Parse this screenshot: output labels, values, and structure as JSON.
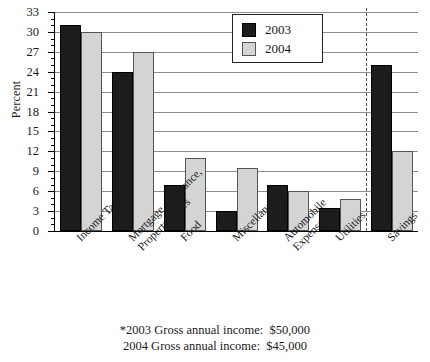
{
  "chart_data": {
    "type": "bar",
    "title": "",
    "xlabel": "",
    "ylabel": "Percent",
    "ylim": [
      0,
      33
    ],
    "ytick_step": 3,
    "yticks": [
      0,
      3,
      6,
      9,
      12,
      15,
      18,
      21,
      24,
      27,
      30,
      33
    ],
    "ytick_labels": [
      "0",
      "3",
      "6",
      "9",
      "12",
      "15",
      "18",
      "21",
      "24",
      "27",
      "30",
      "33"
    ],
    "grid": true,
    "legend_position": "upper center",
    "categories": [
      "Income Taxes",
      "Mortgage, Insurance, Property Taxes",
      "Food",
      "Miscellaneous",
      "Automobile Expenses",
      "Utilities",
      "Savings"
    ],
    "category_lines": [
      [
        "Income Taxes"
      ],
      [
        "Mortgage, Insurance,",
        "Property Taxes"
      ],
      [
        "Food"
      ],
      [
        "Miscellaneous"
      ],
      [
        "Automobile",
        "Expenses"
      ],
      [
        "Utilities"
      ],
      [
        "Savings"
      ]
    ],
    "series": [
      {
        "name": "2003",
        "color": "#1c1c1c",
        "values": [
          31,
          24,
          7,
          3,
          7,
          3.5,
          25
        ]
      },
      {
        "name": "2004",
        "color": "#d4d4d4",
        "values": [
          30,
          27,
          11,
          9.5,
          6,
          4.8,
          12
        ]
      }
    ],
    "annotations": {
      "divider_after_category": "Utilities"
    }
  },
  "legend": {
    "items": [
      {
        "label": "2003",
        "swatch": "black-square-icon"
      },
      {
        "label": "2004",
        "swatch": "gray-square-icon"
      }
    ]
  },
  "footnote": {
    "lines": [
      "*2003 Gross annual income:  $50,000",
      "2004 Gross annual income:  $45,000"
    ]
  }
}
